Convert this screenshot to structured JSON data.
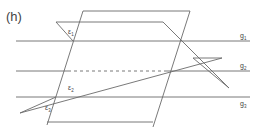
{
  "figure": {
    "label": "(h)",
    "lines": [
      {
        "name": "g",
        "sub": "1"
      },
      {
        "name": "g",
        "sub": "2"
      },
      {
        "name": "g",
        "sub": "3"
      }
    ],
    "planes": [
      {
        "name": "ε",
        "sub": "1"
      },
      {
        "name": "ε",
        "sub": "2"
      },
      {
        "name": "ε",
        "sub": "3"
      }
    ],
    "colors": {
      "stroke": "#6a6a6a",
      "text": "#444444",
      "background": "#ffffff"
    }
  }
}
